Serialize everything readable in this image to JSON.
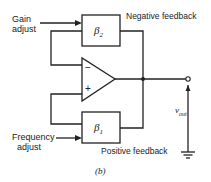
{
  "diagram": {
    "gain_adjust": "Gain\nadjust",
    "gain_line1": "Gain",
    "gain_line2": "adjust",
    "freq_line1": "Frequency",
    "freq_line2": "adjust",
    "beta2": "β",
    "beta2_sub": "2",
    "beta1": "β",
    "beta1_sub": "1",
    "negative_feedback": "Negative feedback",
    "positive_feedback": "Positive feedback",
    "minus": "−",
    "plus": "+",
    "vout": "v",
    "vout_sub": "out",
    "caption": "(b)"
  }
}
